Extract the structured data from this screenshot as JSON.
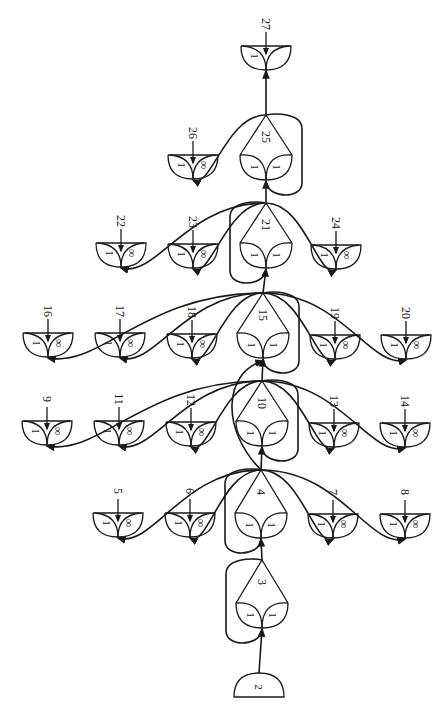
{
  "diagram": {
    "orientation": "rotated-90",
    "colors": {
      "ink": "#1a1a1a",
      "background": "#ffffff"
    },
    "source_node": {
      "id": "2",
      "label": "2",
      "cx": 259,
      "y": 673
    },
    "hubs": [
      {
        "id": "3",
        "label": "3",
        "cx": 262,
        "apex": 560,
        "petal_top": 603,
        "left": "1",
        "right": "1"
      },
      {
        "id": "4",
        "label": "4",
        "cx": 261,
        "apex": 470,
        "petal_top": 513,
        "left": "1",
        "right": "1"
      },
      {
        "id": "10",
        "label": "10",
        "cx": 262,
        "apex": 381,
        "petal_top": 421,
        "left": "1",
        "right": "1"
      },
      {
        "id": "15",
        "label": "15",
        "cx": 263,
        "apex": 293,
        "petal_top": 333,
        "left": "1",
        "right": "1"
      },
      {
        "id": "21",
        "label": "21",
        "cx": 266,
        "apex": 203,
        "petal_top": 243,
        "left": "1",
        "right": "1"
      },
      {
        "id": "25",
        "label": "25",
        "cx": 266,
        "apex": 115,
        "petal_top": 155,
        "left": "1",
        "right": "1"
      }
    ],
    "leaves": [
      {
        "id": "5",
        "label": "5",
        "cx": 118,
        "top": 513,
        "left": "1",
        "right": "∞",
        "hub": "4"
      },
      {
        "id": "6",
        "label": "6",
        "cx": 190,
        "top": 513,
        "left": "1",
        "right": "∞",
        "hub": "4"
      },
      {
        "id": "7",
        "label": "7",
        "cx": 333,
        "top": 514,
        "left": "1",
        "right": "∞",
        "hub": "4"
      },
      {
        "id": "8",
        "label": "8",
        "cx": 405,
        "top": 514,
        "left": "1",
        "right": "∞",
        "hub": "4"
      },
      {
        "id": "9",
        "label": "9",
        "cx": 47,
        "top": 421,
        "left": "1",
        "right": "∞",
        "hub": "10"
      },
      {
        "id": "11",
        "label": "11",
        "cx": 119,
        "top": 421,
        "left": "1",
        "right": "∞",
        "hub": "10"
      },
      {
        "id": "12",
        "label": "12",
        "cx": 191,
        "top": 422,
        "left": "1",
        "right": "∞",
        "hub": "10"
      },
      {
        "id": "13",
        "label": "13",
        "cx": 334,
        "top": 423,
        "left": "1",
        "right": "∞",
        "hub": "10"
      },
      {
        "id": "14",
        "label": "14",
        "cx": 405,
        "top": 423,
        "left": "1",
        "right": "∞",
        "hub": "10"
      },
      {
        "id": "16",
        "label": "16",
        "cx": 48,
        "top": 333,
        "left": "1",
        "right": "∞",
        "hub": "15"
      },
      {
        "id": "17",
        "label": "17",
        "cx": 120,
        "top": 333,
        "left": "1",
        "right": "∞",
        "hub": "15"
      },
      {
        "id": "18",
        "label": "18",
        "cx": 192,
        "top": 334,
        "left": "1",
        "right": "∞",
        "hub": "15"
      },
      {
        "id": "19",
        "label": "19",
        "cx": 335,
        "top": 335,
        "left": "1",
        "right": "∞",
        "hub": "15"
      },
      {
        "id": "20",
        "label": "20",
        "cx": 406,
        "top": 335,
        "left": "1",
        "right": "∞",
        "hub": "15"
      },
      {
        "id": "22",
        "label": "22",
        "cx": 121,
        "top": 243,
        "left": "1",
        "right": "∞",
        "hub": "21"
      },
      {
        "id": "23",
        "label": "23",
        "cx": 193,
        "top": 244,
        "left": "1",
        "right": "∞",
        "hub": "21"
      },
      {
        "id": "24",
        "label": "24",
        "cx": 336,
        "top": 245,
        "left": "1",
        "right": "∞",
        "hub": "21"
      },
      {
        "id": "26",
        "label": "26",
        "cx": 193,
        "top": 155,
        "left": "1",
        "right": "∞",
        "hub": "25"
      },
      {
        "id": "27",
        "label": "27",
        "cx": 266,
        "top": 46,
        "left": "1",
        "right": "",
        "hub": "25"
      }
    ]
  }
}
